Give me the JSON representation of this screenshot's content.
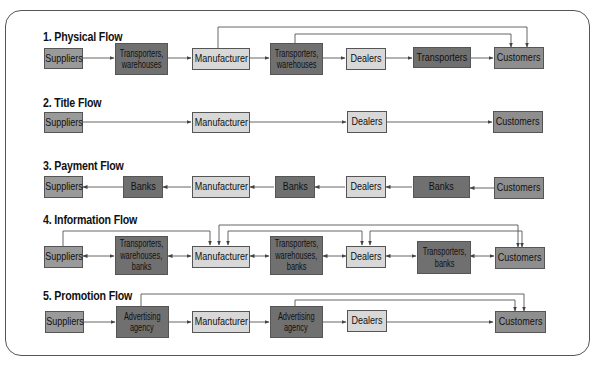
{
  "diagram": {
    "colors": {
      "suppliers": "#9a9a9a",
      "intermediary": "#707070",
      "manufacturer_dealers": "#d8d8d8",
      "customers": "#8e8e8e",
      "line": "#555555"
    },
    "flows": [
      {
        "title": "1. Physical Flow",
        "nodes": [
          "Suppliers",
          "Transporters,\nwarehouses",
          "Manufacturer",
          "Transporters,\nwarehouses",
          "Dealers",
          "Transporters",
          "Customers"
        ],
        "direction": "forward",
        "bypass": [
          "Manufacturer → Customers",
          "Transporters, warehouses → Customers"
        ]
      },
      {
        "title": "2. Title Flow",
        "nodes": [
          "Suppliers",
          "Manufacturer",
          "Dealers",
          "Customers"
        ],
        "direction": "forward"
      },
      {
        "title": "3. Payment Flow",
        "nodes": [
          "Suppliers",
          "Banks",
          "Manufacturer",
          "Banks",
          "Dealers",
          "Banks",
          "Customers"
        ],
        "direction": "backward"
      },
      {
        "title": "4. Information Flow",
        "nodes": [
          "Suppliers",
          "Transporters,\nwarehouses,\nbanks",
          "Manufacturer",
          "Transporters,\nwarehouses,\nbanks",
          "Dealers",
          "Transporters,\nbanks",
          "Customers"
        ],
        "direction": "bidirectional",
        "bypass": [
          "Suppliers → Manufacturer",
          "Manufacturer ↔ Dealers",
          "Manufacturer → Customers",
          "Dealers → Customers"
        ]
      },
      {
        "title": "5. Promotion Flow",
        "nodes": [
          "Suppliers",
          "Advertising\nagency",
          "Manufacturer",
          "Advertising\nagency",
          "Dealers",
          "Customers"
        ],
        "direction": "forward",
        "bypass": [
          "Advertising agency → Customers",
          "Advertising agency → Customers"
        ]
      }
    ]
  },
  "labels": {
    "f1": {
      "title": "1. Physical Flow",
      "n1": "Suppliers",
      "n2a": "Transporters,",
      "n2b": "warehouses",
      "n3": "Manufacturer",
      "n4a": "Transporters,",
      "n4b": "warehouses",
      "n5": "Dealers",
      "n6": "Transporters",
      "n7": "Customers"
    },
    "f2": {
      "title": "2. Title Flow",
      "n1": "Suppliers",
      "n2": "Manufacturer",
      "n3": "Dealers",
      "n4": "Customers"
    },
    "f3": {
      "title": "3. Payment Flow",
      "n1": "Suppliers",
      "n2": "Banks",
      "n3": "Manufacturer",
      "n4": "Banks",
      "n5": "Dealers",
      "n6": "Banks",
      "n7": "Customers"
    },
    "f4": {
      "title": "4. Information Flow",
      "n1": "Suppliers",
      "n2a": "Transporters,",
      "n2b": "warehouses,",
      "n2c": "banks",
      "n3": "Manufacturer",
      "n4a": "Transporters,",
      "n4b": "warehouses,",
      "n4c": "banks",
      "n5": "Dealers",
      "n6a": "Transporters,",
      "n6b": "banks",
      "n7": "Customers"
    },
    "f5": {
      "title": "5. Promotion Flow",
      "n1": "Suppliers",
      "n2a": "Advertising",
      "n2b": "agency",
      "n3": "Manufacturer",
      "n4a": "Advertising",
      "n4b": "agency",
      "n5": "Dealers",
      "n6": "Customers"
    }
  }
}
